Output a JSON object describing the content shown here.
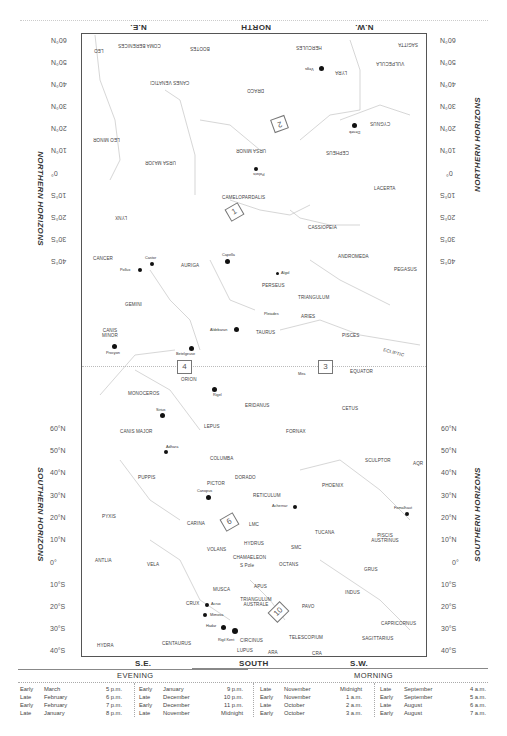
{
  "directions": {
    "top": {
      "ne": "N.E.",
      "north": "NORTH",
      "nw": "N.W."
    },
    "bottom": {
      "se": "S.E.",
      "south": "SOUTH",
      "sw": "S.W."
    }
  },
  "side_labels": {
    "northern": "NORTHERN HORIZONS",
    "southern": "SOUTHERN HORIZONS"
  },
  "northern_ticks": [
    "60°N",
    "50°N",
    "40°N",
    "30°N",
    "20°N",
    "10°N",
    "0°",
    "10°S",
    "20°S",
    "30°S",
    "40°S"
  ],
  "southern_ticks": [
    "60°N",
    "50°N",
    "40°N",
    "30°N",
    "20°N",
    "10°N",
    "0°",
    "10°S",
    "20°S",
    "30°S",
    "40°S"
  ],
  "region_boxes": {
    "b1": "1",
    "b2": "2",
    "b3": "3",
    "b4": "4",
    "b6": "6",
    "b10": "10"
  },
  "constellations": {
    "leo": "LEO",
    "coma": "COMA BERENICES",
    "bootes": "BOOTES",
    "hercules": "HERCULES",
    "sagitta": "SAGITTA",
    "vulpecula": "VULPECULA",
    "lyra": "LYRA",
    "canes": "CANES VENATICI",
    "draco": "DRACO",
    "leo_minor": "LEO MINOR",
    "ursa_major": "URSA MAJOR",
    "ursa_minor": "URSA MINOR",
    "cygnus": "CYGNUS",
    "cepheus": "CEPHEUS",
    "lacerta": "LACERTA",
    "camelopardalis": "CAMELOPARDALIS",
    "lynx": "LYNX",
    "cassiopeia": "CASSIOPEIA",
    "cancer": "CANCER",
    "auriga": "AURIGA",
    "andromeda": "ANDROMEDA",
    "pegasus": "PEGASUS",
    "perseus": "PERSEUS",
    "gemini": "GEMINI",
    "triangulum": "TRIANGULUM",
    "aries": "ARIES",
    "canis_minor": "CANIS MINOR",
    "taurus": "TAURUS",
    "pisces": "PISCES",
    "ecliptic": "ECLIPTIC",
    "orion": "ORION",
    "equator": "EQUATOR",
    "monoceros": "MONOCEROS",
    "eridanus": "ERIDANUS",
    "cetus": "CETUS",
    "canis_major": "CANIS MAJOR",
    "lepus": "LEPUS",
    "fornax": "FORNAX",
    "columba": "COLUMBA",
    "sculptor": "SCULPTOR",
    "aqr": "AQR",
    "puppis": "PUPPIS",
    "pictor": "PICTOR",
    "dorado": "DORADO",
    "phoenix": "PHOENIX",
    "reticulum": "RETICULUM",
    "pyxis": "PYXIS",
    "carina": "CARINA",
    "lmc": "LMC",
    "hydrus": "HYDRUS",
    "tucana": "TUCANA",
    "piscis_austrinus": "PISCIS AUSTRINUS",
    "antlia": "ANTLIA",
    "vela": "VELA",
    "volans": "VOLANS",
    "chamaeleon": "CHAMAELEON",
    "smc": "SMC",
    "octans": "OCTANS",
    "grus": "GRUS",
    "s_pole": "S Pole",
    "indus": "INDUS",
    "musca": "MUSCA",
    "apus": "APUS",
    "crux": "CRUX",
    "triangulum_australe": "TRIANGULUM AUSTRALE",
    "pavo": "PAVO",
    "capricornus": "CAPRICORNUS",
    "centaurus": "CENTAURUS",
    "circinus": "CIRCINUS",
    "telescopium": "TELESCOPIUM",
    "sagittarius": "SAGITTARIUS",
    "hydra": "HYDRA",
    "lupus": "LUPUS",
    "ara": "ARA",
    "cra": "CRA"
  },
  "stars": {
    "vega": "Vega",
    "deneb": "Deneb",
    "polaris": "Polaris",
    "capella": "Capella",
    "castor": "Castor",
    "pollux": "Pollux",
    "algol": "Algol",
    "pleiades": "Pleiades",
    "aldebaran": "Aldebaran",
    "procyon": "Procyon",
    "betelgeuse": "Betelgeuse",
    "rigel": "Rigel",
    "mira": "Mira",
    "sirius": "Sirius",
    "adhara": "Adhara",
    "canopus": "Canopus",
    "achernar": "Achernar",
    "fomalhaut": "Fomalhaut",
    "acrux": "Acrux",
    "mimosa": "Mimosa",
    "hadar": "Hadar",
    "rigil_kent": "Rigil Kent"
  },
  "times": {
    "evening_label": "EVENING",
    "morning_label": "MORNING",
    "evening": [
      [
        [
          "Early",
          "March",
          "5 p.m."
        ],
        [
          "Late",
          "February",
          "6 p.m."
        ],
        [
          "Early",
          "February",
          "7 p.m."
        ],
        [
          "Late",
          "January",
          "8 p.m."
        ]
      ],
      [
        [
          "Early",
          "January",
          "9 p.m."
        ],
        [
          "Late",
          "December",
          "10 p.m."
        ],
        [
          "Early",
          "December",
          "11 p.m."
        ],
        [
          "Late",
          "November",
          "Midnight"
        ]
      ]
    ],
    "morning": [
      [
        [
          "Late",
          "November",
          "Midnight"
        ],
        [
          "Early",
          "November",
          "1 a.m."
        ],
        [
          "Late",
          "October",
          "2 a.m."
        ],
        [
          "Early",
          "October",
          "3 a.m."
        ]
      ],
      [
        [
          "Late",
          "September",
          "4 a.m."
        ],
        [
          "Early",
          "September",
          "5 a.m."
        ],
        [
          "Late",
          "August",
          "6 a.m."
        ],
        [
          "Early",
          "August",
          "7 a.m."
        ]
      ]
    ]
  }
}
